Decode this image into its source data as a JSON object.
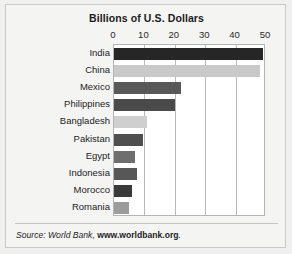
{
  "chart_data": {
    "type": "bar",
    "orientation": "horizontal",
    "title": "Billions of U.S. Dollars",
    "xlabel": "",
    "ylabel": "",
    "categories": [
      "India",
      "China",
      "Mexico",
      "Philippines",
      "Bangladesh",
      "Pakistan",
      "Egypt",
      "Indonesia",
      "Morocco",
      "Romania"
    ],
    "values": [
      49,
      48,
      22,
      20,
      11,
      9.5,
      7,
      7.5,
      6,
      5
    ],
    "bar_colors": [
      "#262626",
      "#c9c9c9",
      "#595959",
      "#4a4a4a",
      "#cfcfcf",
      "#4f4f4f",
      "#6e6e6e",
      "#575757",
      "#3a3a3a",
      "#9c9c9c"
    ],
    "xlim": [
      0,
      50
    ],
    "xticks": [
      0,
      10,
      20,
      30,
      40,
      50
    ],
    "xtick_labels": [
      "0",
      "10",
      "20",
      "30",
      "40",
      "50"
    ],
    "gridlines": [
      10,
      20,
      30,
      40
    ],
    "grid": true,
    "legend": "none"
  },
  "source": {
    "prefix": "Source: World Bank, ",
    "url": "www.worldbank.org",
    "suffix": "."
  },
  "colors": {
    "page_background": "#f0f0f0",
    "figure_background": "#f4f4f3",
    "plot_background": "#ffffff",
    "frame": "#c9c9c7",
    "gridline": "#b8b8b6",
    "text": "#1b1b1b"
  }
}
